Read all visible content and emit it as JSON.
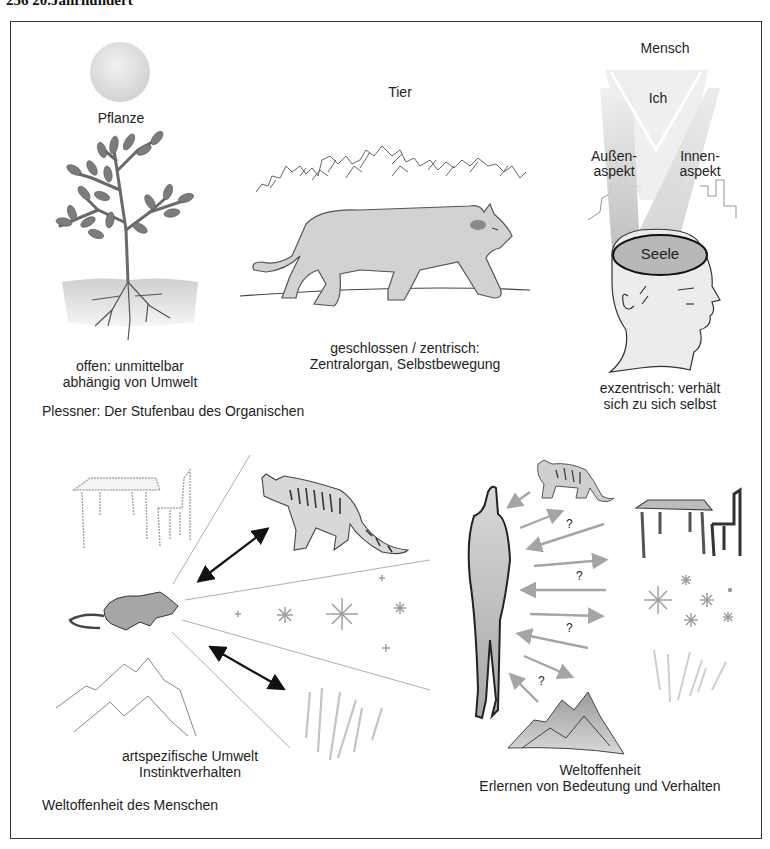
{
  "page": {
    "header": "256  20.Jahrhundert"
  },
  "top_section": {
    "caption": "Plessner: Der Stufenbau des Organischen",
    "plant": {
      "title": "Pflanze",
      "description_line1": "offen: unmittelbar",
      "description_line2": "abhängig von Umwelt",
      "icons": [
        "sun-icon",
        "tree-icon",
        "soil-roots-icon"
      ]
    },
    "animal": {
      "title": "Tier",
      "description_line1": "geschlossen / zentrisch:",
      "description_line2": "Zentralorgan, Selbstbewegung",
      "icons": [
        "bushes-icon",
        "walking-cat-icon",
        "ground-line"
      ]
    },
    "human": {
      "title": "Mensch",
      "ich_label": "Ich",
      "outer_aspect_line1": "Außen-",
      "outer_aspect_line2": "aspekt",
      "inner_aspect_line1": "Innen-",
      "inner_aspect_line2": "aspekt",
      "soul_label": "Seele",
      "description_line1": "exzentrisch: verhält",
      "description_line2": "sich zu sich selbst",
      "icons": [
        "light-beams-icon",
        "city-skyline-icon",
        "human-head-icon",
        "soul-ellipse"
      ]
    }
  },
  "bottom_section": {
    "caption": "Weltoffenheit des Menschen",
    "animal_world": {
      "description_line1": "artspezifische Umwelt",
      "description_line2": "Instinktverhalten",
      "icons": [
        "rat-icon",
        "tabby-cat-icon",
        "table-chair-icon",
        "stars-icon",
        "mountains-icon",
        "wheat-icon",
        "double-arrow-icon"
      ]
    },
    "human_world": {
      "description_line1": "Weltoffenheit",
      "description_line2": "Erlernen von Bedeutung und Verhalten",
      "question_mark": "?",
      "icons": [
        "human-silhouette-icon",
        "small-cat-icon",
        "table-chair-icon",
        "stars-icon",
        "wheat-icon",
        "mountains-icon",
        "arrows-icon"
      ]
    }
  },
  "colors": {
    "frame": "#333333",
    "fill_gray": "#c8c8c8",
    "dark_gray": "#555555",
    "light_gray": "#e2e2e2",
    "soul_fill": "#b5b5b5"
  }
}
